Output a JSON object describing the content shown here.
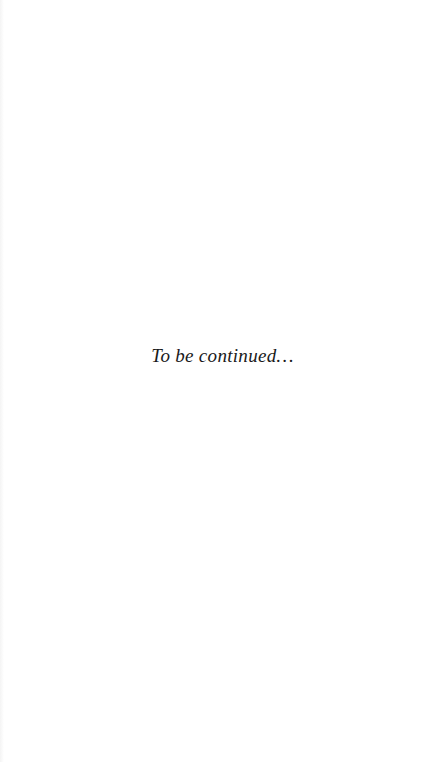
{
  "page": {
    "background": "#ffffff",
    "text_color": "#1a1a1a",
    "closing_text": "To be continued…"
  }
}
